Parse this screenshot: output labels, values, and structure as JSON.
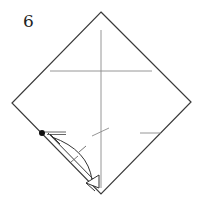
{
  "step": {
    "number": "6"
  },
  "diagram": {
    "colors": {
      "outline": "#3a3a3a",
      "crease": "#8a8a8a",
      "arrow": "#333333",
      "dot": "#111111",
      "background": "#ffffff"
    },
    "paper": {
      "shape": "square-diamond",
      "vertices": {
        "top": [
          101,
          12
        ],
        "right": [
          191,
          102
        ],
        "bottom": [
          101,
          194
        ],
        "left": [
          12,
          103
        ]
      }
    },
    "creases": [
      {
        "type": "vertical-center",
        "from": [
          101,
          30
        ],
        "to": [
          101,
          188
        ]
      },
      {
        "type": "horizontal",
        "from": [
          50,
          71
        ],
        "to": [
          152,
          71
        ]
      },
      {
        "type": "short-horizontal-right",
        "from": [
          140,
          133
        ],
        "to": [
          161,
          133
        ]
      },
      {
        "type": "short-diagonal",
        "from": [
          92,
          136
        ],
        "to": [
          109,
          128
        ]
      }
    ],
    "reference_point": {
      "icon": "dot",
      "at": [
        42,
        133
      ]
    },
    "fold_arrow": {
      "type": "valley-fold-arrow",
      "from": [
        101,
        194
      ],
      "to": [
        42,
        133
      ]
    }
  }
}
